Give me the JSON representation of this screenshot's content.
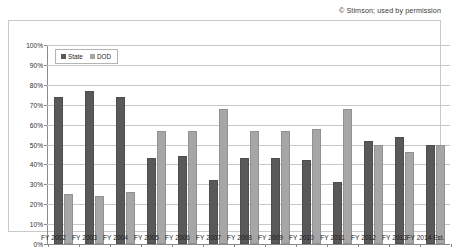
{
  "attribution": "© Stimson; used by permission",
  "chart_data": {
    "type": "bar",
    "title": "",
    "subtitle": "",
    "xlabel": "",
    "ylabel": "",
    "ylim": [
      0,
      100
    ],
    "grid": true,
    "legend_position": "top-left",
    "y_ticks": [
      "0%",
      "10%",
      "20%",
      "30%",
      "40%",
      "50%",
      "60%",
      "70%",
      "80%",
      "90%",
      "100%"
    ],
    "y_tick_values": [
      0,
      10,
      20,
      30,
      40,
      50,
      60,
      70,
      80,
      90,
      100
    ],
    "categories": [
      "FY 2002",
      "FY 2003",
      "FY 2004",
      "FY 2005",
      "FY 2006",
      "FY 2007",
      "FY 2008",
      "FY 2009",
      "FY 2010",
      "FY 2011",
      "FY 2012",
      "FY 2013",
      "FY 2014 Est."
    ],
    "series": [
      {
        "name": "State",
        "color": "#595959",
        "values": [
          74,
          77,
          74,
          43,
          44,
          32,
          43,
          43,
          42,
          31,
          52,
          54,
          50
        ]
      },
      {
        "name": "DOD",
        "color": "#a6a6a6",
        "values": [
          25,
          24,
          26,
          57,
          57,
          68,
          57,
          57,
          58,
          68,
          50,
          46,
          50
        ]
      }
    ]
  }
}
